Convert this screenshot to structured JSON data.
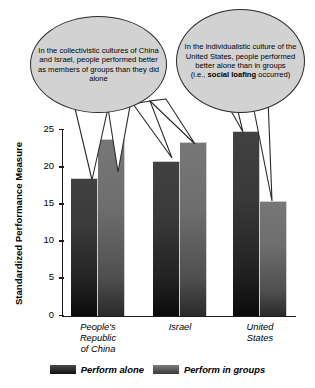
{
  "chart_data": {
    "type": "bar",
    "title": "",
    "xlabel": "",
    "ylabel": "Standardized Performance Measure",
    "ylim": [
      0,
      25
    ],
    "yticks": [
      0,
      5,
      10,
      15,
      20,
      25
    ],
    "ytick_labels": [
      "0",
      "5",
      "10",
      "15",
      "20",
      "25"
    ],
    "grid": false,
    "legend_position": "bottom",
    "categories": [
      "People's Republic of China",
      "Israel",
      "United States"
    ],
    "category_lines": [
      [
        "People's",
        "Republic",
        "of China"
      ],
      [
        "Israel"
      ],
      [
        "United",
        "States"
      ]
    ],
    "series": [
      {
        "name": "Perform alone",
        "values": [
          18.5,
          20.7,
          24.7
        ],
        "color": "#3a3a3a"
      },
      {
        "name": "Perform in groups",
        "values": [
          23.7,
          23.2,
          15.4
        ],
        "color": "#6e6e6e"
      }
    ]
  },
  "annotations": [
    {
      "id": "left-callout",
      "text": "In the collectivistic cultures of China and Israel, people performed better as members of groups than they did alone",
      "lines": [
        "In the collectivistic",
        "cultures of China and Israel,",
        "people performed better",
        "as members of groups",
        "than they did alone"
      ],
      "bold_terms": []
    },
    {
      "id": "right-callout",
      "text": "In the individualistic culture of the United States, people performed better alone than in groups (i.e., social loafing occurred)",
      "lines": [
        "In the individualistic",
        "culture of the United",
        "States, people performed",
        "better alone than in",
        "groups (i.e., "
      ],
      "bold_terms": [
        "social loafing"
      ]
    }
  ],
  "legend": {
    "items": [
      {
        "label": "Perform alone",
        "swatch": "dark-gray"
      },
      {
        "label": "Perform in groups",
        "swatch": "medium-gray"
      }
    ]
  },
  "colors": {
    "bubble_fill": "#d2d2d2",
    "bubble_stroke": "#2b2b2b",
    "axis": "#1a1a1a",
    "bar_alone": "#3a3a3a",
    "bar_groups": "#6e6e6e",
    "background": "#ffffff"
  }
}
